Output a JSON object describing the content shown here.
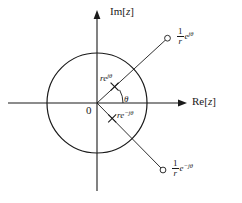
{
  "figure": {
    "type": "complex-plane-diagram",
    "background": "#ffffff",
    "stroke_color": "#1a1a1a",
    "width": 242,
    "height": 203,
    "axes": {
      "imaginary_label": "Im[",
      "imaginary_var": "z",
      "imaginary_close": "]",
      "real_label": "Re[",
      "real_var": "z",
      "real_close": "]",
      "origin_label": "0"
    },
    "angle": {
      "symbol": "θ"
    },
    "unit_circle": {
      "center_x": 97,
      "center_y": 103,
      "radius": 50
    },
    "points": [
      {
        "id": "zero-upper",
        "marker": "open-circle",
        "numerator": "1",
        "denominator": "r",
        "base": "e",
        "exponent": "jθ",
        "x": 167,
        "y": 38
      },
      {
        "id": "pole-upper",
        "marker": "cross",
        "prefix": "r",
        "base": "e",
        "exponent": "jθ",
        "x": 115,
        "y": 87
      },
      {
        "id": "pole-lower",
        "marker": "cross",
        "prefix": "r",
        "base": "e",
        "exponent": "−jθ",
        "x": 112,
        "y": 118
      },
      {
        "id": "zero-lower",
        "marker": "open-circle",
        "numerator": "1",
        "denominator": "r",
        "base": "e",
        "exponent": "−jθ",
        "x": 163,
        "y": 170
      }
    ]
  }
}
